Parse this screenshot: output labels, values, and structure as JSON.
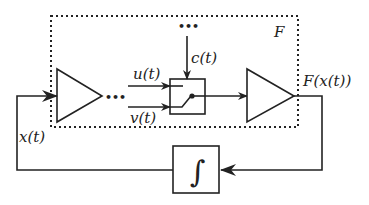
{
  "diagram": {
    "type": "block-diagram",
    "outer_block_label": "F",
    "labels": {
      "input": "x(t)",
      "u": "u(t)",
      "v": "v(t)",
      "control": "c(t)",
      "output": "F(x(t))",
      "integrator_symbol": "∫"
    },
    "ellipsis": "•••",
    "nodes": [
      {
        "id": "amp1",
        "shape": "triangle"
      },
      {
        "id": "switch",
        "shape": "box",
        "content": "switch"
      },
      {
        "id": "amp2",
        "shape": "triangle"
      },
      {
        "id": "integrator",
        "shape": "box",
        "content": "∫"
      }
    ],
    "edges": [
      {
        "from": "integrator",
        "to": "amp1",
        "label": "x(t)"
      },
      {
        "from": "u-input",
        "to": "switch",
        "label": "u(t)"
      },
      {
        "from": "v-input",
        "to": "switch",
        "label": "v(t)"
      },
      {
        "from": "control-input",
        "to": "switch",
        "label": "c(t)"
      },
      {
        "from": "switch",
        "to": "amp2"
      },
      {
        "from": "amp2",
        "to": "integrator",
        "label": "F(x(t))"
      }
    ],
    "colors": {
      "stroke": "#222222",
      "background": "#ffffff"
    }
  }
}
